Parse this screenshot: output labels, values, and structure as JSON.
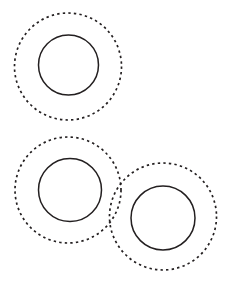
{
  "figure": {
    "title": "",
    "background_color": "#ffffff",
    "stroke_color": "#231f20",
    "width": 227,
    "height": 283
  },
  "chart_data": {
    "type": "scatter",
    "title": "",
    "subtitle": "",
    "xlabel": "",
    "ylabel": "",
    "xlim": [
      0,
      227
    ],
    "ylim": [
      0,
      283
    ],
    "grid": false,
    "legend": "none",
    "annotations": [],
    "groups": [
      {
        "name": "group-top-left",
        "inner": {
          "cx": 68.5,
          "cy": 65,
          "r": 30,
          "style": "solid"
        },
        "outer": {
          "cx": 68,
          "cy": 66.5,
          "r": 53.5,
          "style": "dashed"
        }
      },
      {
        "name": "group-bottom-left",
        "inner": {
          "cx": 70,
          "cy": 190,
          "r": 31.5,
          "style": "solid"
        },
        "outer": {
          "cx": 68,
          "cy": 190,
          "r": 53,
          "style": "dashed"
        }
      },
      {
        "name": "group-bottom-right",
        "inner": {
          "cx": 163,
          "cy": 218,
          "r": 32,
          "style": "solid"
        },
        "outer": {
          "cx": 163,
          "cy": 216.5,
          "r": 53.5,
          "style": "dashed"
        }
      }
    ]
  }
}
